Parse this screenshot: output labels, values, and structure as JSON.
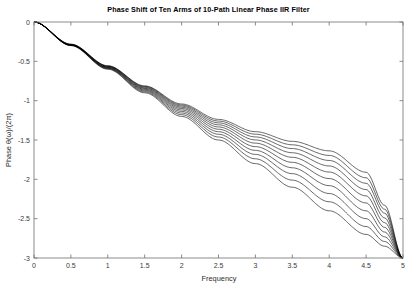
{
  "chart_data": {
    "type": "line",
    "title": "Phase Shift of Ten Arms of 10-Path Linear Phase IIR Filter",
    "xlabel": "Frequency",
    "ylabel": "Phase θ(ω)/(2π)",
    "xlim": [
      0,
      5
    ],
    "ylim": [
      -3,
      0
    ],
    "xticks": [
      0,
      0.5,
      1,
      1.5,
      2,
      2.5,
      3,
      3.5,
      4,
      4.5,
      5
    ],
    "xtick_labels": [
      "0",
      "0.5",
      "1",
      "1.5",
      "2",
      "2.5",
      "3",
      "3.5",
      "4",
      "4.5",
      "5"
    ],
    "yticks": [
      -3,
      -2.5,
      -2,
      -1.5,
      -1,
      -0.5,
      0
    ],
    "ytick_labels": [
      "-3",
      "-2.5",
      "-2",
      "-1.5",
      "-1",
      "-0.5",
      "0"
    ],
    "grid": false,
    "legend": null,
    "series_count": 10,
    "line_color": "#000000",
    "series": [
      {
        "name": "Arm 1",
        "x": [
          0,
          0.5,
          1,
          1.5,
          2,
          2.5,
          3,
          3.5,
          4,
          4.5,
          4.75,
          5
        ],
        "values": [
          0,
          -0.3,
          -0.6,
          -0.9,
          -1.2,
          -1.5,
          -1.8,
          -2.1,
          -2.4,
          -2.7,
          -2.85,
          -3
        ]
      },
      {
        "name": "Arm 2",
        "x": [
          0,
          0.5,
          1,
          1.5,
          2,
          2.5,
          3,
          3.5,
          4,
          4.5,
          4.75,
          5
        ],
        "values": [
          0,
          -0.298,
          -0.594,
          -0.888,
          -1.178,
          -1.462,
          -1.739,
          -2.01,
          -2.285,
          -2.6,
          -2.79,
          -3
        ]
      },
      {
        "name": "Arm 3",
        "x": [
          0,
          0.5,
          1,
          1.5,
          2,
          2.5,
          3,
          3.5,
          4,
          4.5,
          4.75,
          5
        ],
        "values": [
          0,
          -0.296,
          -0.588,
          -0.876,
          -1.157,
          -1.427,
          -1.683,
          -1.928,
          -2.18,
          -2.5,
          -2.73,
          -3
        ]
      },
      {
        "name": "Arm 4",
        "x": [
          0,
          0.5,
          1,
          1.5,
          2,
          2.5,
          3,
          3.5,
          4,
          4.5,
          4.75,
          5
        ],
        "values": [
          0,
          -0.294,
          -0.583,
          -0.865,
          -1.137,
          -1.394,
          -1.632,
          -1.853,
          -2.08,
          -2.4,
          -2.67,
          -3
        ]
      },
      {
        "name": "Arm 5",
        "x": [
          0,
          0.5,
          1,
          1.5,
          2,
          2.5,
          3,
          3.5,
          4,
          4.5,
          4.75,
          5
        ],
        "values": [
          0,
          -0.292,
          -0.578,
          -0.855,
          -1.118,
          -1.363,
          -1.584,
          -1.784,
          -1.99,
          -2.3,
          -2.61,
          -3
        ]
      },
      {
        "name": "Arm 6",
        "x": [
          0,
          0.5,
          1,
          1.5,
          2,
          2.5,
          3,
          3.5,
          4,
          4.5,
          4.75,
          5
        ],
        "values": [
          0,
          -0.29,
          -0.573,
          -0.845,
          -1.1,
          -1.334,
          -1.54,
          -1.72,
          -1.907,
          -2.21,
          -2.55,
          -3
        ]
      },
      {
        "name": "Arm 7",
        "x": [
          0,
          0.5,
          1,
          1.5,
          2,
          2.5,
          3,
          3.5,
          4,
          4.5,
          4.75,
          5
        ],
        "values": [
          0,
          -0.288,
          -0.568,
          -0.836,
          -1.084,
          -1.307,
          -1.499,
          -1.662,
          -1.83,
          -2.13,
          -2.49,
          -3
        ]
      },
      {
        "name": "Arm 8",
        "x": [
          0,
          0.5,
          1,
          1.5,
          2,
          2.5,
          3,
          3.5,
          4,
          4.5,
          4.75,
          5
        ],
        "values": [
          0,
          -0.286,
          -0.564,
          -0.827,
          -1.069,
          -1.282,
          -1.461,
          -1.609,
          -1.76,
          -2.05,
          -2.43,
          -3
        ]
      },
      {
        "name": "Arm 9",
        "x": [
          0,
          0.5,
          1,
          1.5,
          2,
          2.5,
          3,
          3.5,
          4,
          4.5,
          4.75,
          5
        ],
        "values": [
          0,
          -0.284,
          -0.56,
          -0.819,
          -1.055,
          -1.259,
          -1.426,
          -1.561,
          -1.696,
          -1.98,
          -2.38,
          -3
        ]
      },
      {
        "name": "Arm 10",
        "x": [
          0,
          0.5,
          1,
          1.5,
          2,
          2.5,
          3,
          3.5,
          4,
          4.5,
          4.75,
          5
        ],
        "values": [
          0,
          -0.282,
          -0.556,
          -0.812,
          -1.042,
          -1.238,
          -1.394,
          -1.517,
          -1.638,
          -1.91,
          -2.33,
          -3
        ]
      }
    ]
  }
}
